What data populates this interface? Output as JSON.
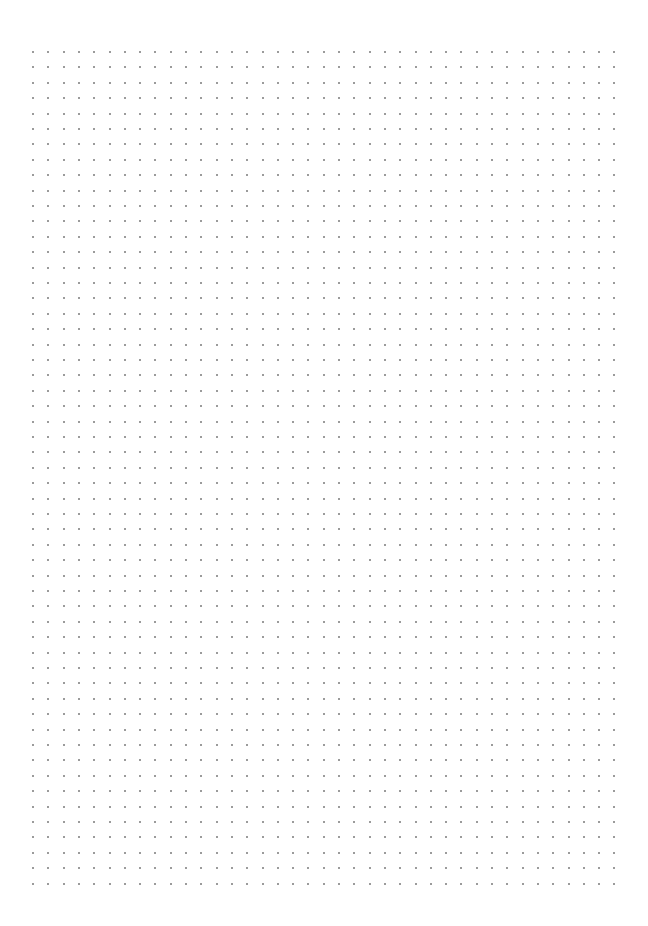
{
  "page": {
    "type": "dot-grid-paper",
    "background_color": "#ffffff",
    "dot_color": "#7a7a7a"
  },
  "grid": {
    "columns": 39,
    "rows": 55,
    "origin_x": 33,
    "origin_y": 52,
    "spacing_x": 15.3,
    "spacing_y": 15.4,
    "dot_size": 2
  }
}
